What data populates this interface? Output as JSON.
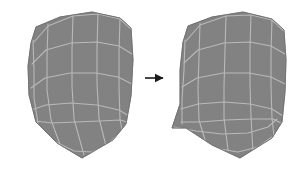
{
  "figure": {
    "type": "diagram",
    "title": "",
    "caption": "",
    "background_color": "#ffffff",
    "width": 308,
    "height": 173
  },
  "style": {
    "mesh_fill_color": "#808080",
    "mesh_fill_color_dark": "#7a7a7a",
    "mesh_outline_color": "#707070",
    "grid_line_color": "#b9b9b9",
    "grid_line_width": 1.1,
    "hatch_line_color": "#8c8c8c",
    "hatch_line_width": 0.35,
    "hatch_spacing": 1.6,
    "arrow_color": "#1a1a1a"
  },
  "arrow": {
    "name": "transformation-arrow",
    "label": "",
    "direction": "right",
    "x1": 145,
    "y1": 78,
    "x2": 163,
    "y2": 78,
    "line_width": 1.6,
    "head_size": 4.5
  },
  "shapes": [
    {
      "id": "left-mesh",
      "name": "Left mesh patch",
      "label": "",
      "outline": [
        [
          31,
          43
        ],
        [
          36,
          27
        ],
        [
          60,
          17
        ],
        [
          92,
          12
        ],
        [
          120,
          18
        ],
        [
          131,
          28
        ],
        [
          133,
          60
        ],
        [
          131,
          96
        ],
        [
          126,
          124
        ],
        [
          113,
          140
        ],
        [
          82,
          158
        ],
        [
          57,
          143
        ],
        [
          36,
          122
        ],
        [
          29,
          95
        ],
        [
          28,
          66
        ]
      ],
      "grid_u_lines": [
        [
          [
            33,
            40
          ],
          [
            34,
            70
          ],
          [
            34,
            98
          ],
          [
            38,
            123
          ]
        ],
        [
          [
            48,
            24
          ],
          [
            47,
            56
          ],
          [
            47,
            90
          ],
          [
            51,
            120
          ],
          [
            61,
            147
          ]
        ],
        [
          [
            73,
            15
          ],
          [
            72,
            50
          ],
          [
            72,
            86
          ],
          [
            74,
            119
          ],
          [
            84,
            155
          ]
        ],
        [
          [
            98,
            13
          ],
          [
            97,
            48
          ],
          [
            97,
            84
          ],
          [
            99,
            118
          ],
          [
            106,
            146
          ]
        ],
        [
          [
            120,
            18
          ],
          [
            119,
            52
          ],
          [
            119,
            87
          ],
          [
            120,
            119
          ],
          [
            122,
            130
          ]
        ]
      ],
      "grid_v_lines": [
        [
          [
            34,
            42
          ],
          [
            48,
            26
          ],
          [
            73,
            16
          ],
          [
            98,
            14
          ],
          [
            120,
            19
          ],
          [
            131,
            29
          ]
        ],
        [
          [
            32,
            64
          ],
          [
            46,
            50
          ],
          [
            71,
            43
          ],
          [
            97,
            42
          ],
          [
            119,
            46
          ],
          [
            132,
            54
          ]
        ],
        [
          [
            31,
            88
          ],
          [
            45,
            78
          ],
          [
            70,
            73
          ],
          [
            96,
            73
          ],
          [
            118,
            77
          ],
          [
            132,
            84
          ]
        ],
        [
          [
            31,
            110
          ],
          [
            46,
            105
          ],
          [
            71,
            103
          ],
          [
            97,
            105
          ],
          [
            119,
            110
          ],
          [
            129,
            116
          ]
        ],
        [
          [
            35,
            121
          ],
          [
            52,
            123
          ],
          [
            76,
            122
          ],
          [
            100,
            121
          ],
          [
            120,
            120
          ],
          [
            127,
            122
          ]
        ],
        [
          [
            56,
            142
          ],
          [
            74,
            151
          ],
          [
            92,
            152
          ],
          [
            108,
            144
          ],
          [
            122,
            131
          ]
        ]
      ],
      "fill": "#808080",
      "stroke": "#b9b9b9"
    },
    {
      "id": "right-mesh",
      "name": "Right mesh patch",
      "label": "",
      "outline": [
        [
          183,
          42
        ],
        [
          188,
          26
        ],
        [
          212,
          17
        ],
        [
          243,
          12
        ],
        [
          272,
          19
        ],
        [
          284,
          30
        ],
        [
          286,
          60
        ],
        [
          285,
          92
        ],
        [
          282,
          122
        ],
        [
          272,
          138
        ],
        [
          240,
          158
        ],
        [
          212,
          145
        ],
        [
          186,
          128
        ],
        [
          172,
          128
        ],
        [
          180,
          104
        ],
        [
          180,
          70
        ]
      ],
      "grid_u_lines": [
        [
          [
            185,
            40
          ],
          [
            184,
            70
          ],
          [
            182,
            100
          ],
          [
            182,
            124
          ]
        ],
        [
          [
            200,
            23
          ],
          [
            199,
            56
          ],
          [
            198,
            90
          ],
          [
            199,
            120
          ],
          [
            206,
            143
          ]
        ],
        [
          [
            226,
            15
          ],
          [
            225,
            50
          ],
          [
            224,
            86
          ],
          [
            224,
            118
          ],
          [
            228,
            150
          ]
        ],
        [
          [
            251,
            14
          ],
          [
            250,
            48
          ],
          [
            250,
            84
          ],
          [
            251,
            117
          ],
          [
            253,
            153
          ]
        ],
        [
          [
            272,
            19
          ],
          [
            271,
            52
          ],
          [
            271,
            87
          ],
          [
            272,
            118
          ],
          [
            274,
            136
          ]
        ]
      ],
      "grid_v_lines": [
        [
          [
            186,
            41
          ],
          [
            200,
            25
          ],
          [
            226,
            16
          ],
          [
            251,
            15
          ],
          [
            272,
            20
          ],
          [
            284,
            31
          ]
        ],
        [
          [
            184,
            63
          ],
          [
            198,
            50
          ],
          [
            224,
            43
          ],
          [
            250,
            42
          ],
          [
            271,
            46
          ],
          [
            285,
            54
          ]
        ],
        [
          [
            182,
            87
          ],
          [
            197,
            78
          ],
          [
            223,
            73
          ],
          [
            249,
            73
          ],
          [
            271,
            77
          ],
          [
            285,
            84
          ]
        ],
        [
          [
            181,
            109
          ],
          [
            198,
            104
          ],
          [
            224,
            102
          ],
          [
            250,
            104
          ],
          [
            272,
            109
          ],
          [
            283,
            116
          ]
        ],
        [
          [
            181,
            122
          ],
          [
            200,
            122
          ],
          [
            226,
            120
          ],
          [
            252,
            119
          ],
          [
            273,
            119
          ],
          [
            281,
            123
          ]
        ],
        [
          [
            174,
            127
          ],
          [
            196,
            131
          ],
          [
            222,
            134
          ],
          [
            248,
            133
          ],
          [
            268,
            127
          ],
          [
            277,
            119
          ]
        ],
        [
          [
            189,
            141
          ],
          [
            214,
            148
          ],
          [
            238,
            152
          ],
          [
            258,
            147
          ],
          [
            272,
            137
          ]
        ]
      ],
      "fill": "#808080",
      "stroke": "#b9b9b9"
    }
  ]
}
